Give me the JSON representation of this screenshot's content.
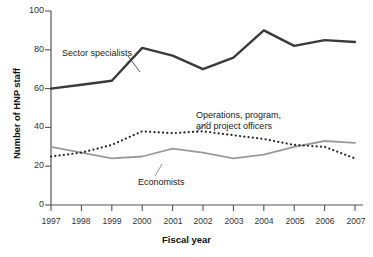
{
  "chart_data": {
    "type": "line",
    "title": "",
    "xlabel": "Fiscal year",
    "ylabel": "Number of HNP staff",
    "categories": [
      "1997",
      "1998",
      "1999",
      "2000",
      "2001",
      "2002",
      "2003",
      "2004",
      "2005",
      "2006",
      "2007"
    ],
    "ylim": [
      0,
      100
    ],
    "yticks": [
      0,
      20,
      40,
      60,
      80,
      100
    ],
    "grid": false,
    "legend": "inline-annotations",
    "series": [
      {
        "name": "Sector specialists",
        "style": "solid-thick",
        "color": "#3a3a3a",
        "values": [
          60,
          62,
          64,
          81,
          77,
          70,
          76,
          90,
          82,
          85,
          84
        ]
      },
      {
        "name": "Operations, program, and project officers",
        "style": "dotted",
        "color": "#2b2b2b",
        "values": [
          25,
          27,
          31,
          38,
          37,
          38,
          36,
          34,
          31,
          30,
          24
        ]
      },
      {
        "name": "Economists",
        "style": "solid-thin",
        "color": "#9a9a9a",
        "values": [
          30,
          27,
          24,
          25,
          29,
          27,
          24,
          26,
          30,
          33,
          32
        ]
      }
    ],
    "annotations": [
      {
        "id": "sector-specialists",
        "text": "Sector specialists"
      },
      {
        "id": "operations-line1",
        "text": "Operations, program,"
      },
      {
        "id": "operations-line2",
        "text": "and project officers"
      },
      {
        "id": "economists",
        "text": "Economists"
      }
    ]
  },
  "axis": {
    "ytick_labels": [
      "100",
      "80",
      "60",
      "40",
      "20",
      "0"
    ],
    "xtick_labels": [
      "1997",
      "1998",
      "1999",
      "2000",
      "2001",
      "2002",
      "2003",
      "2004",
      "2005",
      "2006",
      "2007"
    ]
  }
}
